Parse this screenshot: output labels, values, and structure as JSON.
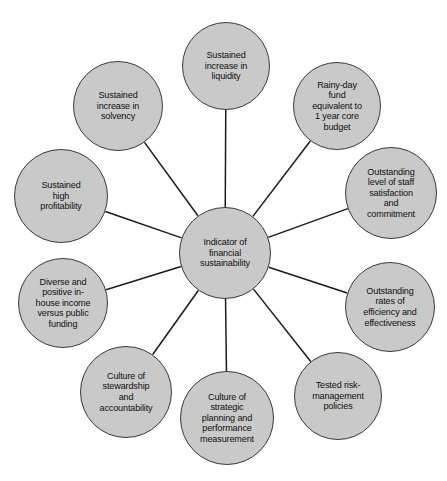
{
  "diagram": {
    "type": "hub-and-spoke",
    "title": "Indicator of financial sustainability",
    "colors": {
      "node_fill": "#c9c9c9",
      "node_border": "#3a3a3a",
      "spoke_line": "#1a1a1a",
      "text": "#101010",
      "background": "#ffffff"
    },
    "hub": {
      "id": "hub",
      "label": "Indicator of\nfinancial\nsustainability",
      "cx": 225,
      "cy": 253,
      "r": 46
    },
    "satellites": [
      {
        "id": "sustained-increase-in-liquidity",
        "label": "Sustained\nincrease in\nliquidity",
        "cx": 226,
        "cy": 66,
        "r": 44
      },
      {
        "id": "rainy-day-fund",
        "label": "Rainy-day\nfund\nequivalent to\n1 year core\nbudget",
        "cx": 337,
        "cy": 106,
        "r": 44
      },
      {
        "id": "staff-satisfaction-and-commitment",
        "label": "Outstanding\nlevel of staff\nsatisfaction\nand\ncommitment",
        "cx": 391,
        "cy": 193,
        "r": 46
      },
      {
        "id": "rates-of-efficiency-and-effectiveness",
        "label": "Outstanding\nrates of\nefficiency and\neffectiveness",
        "cx": 390,
        "cy": 307,
        "r": 45
      },
      {
        "id": "tested-risk-management-policies",
        "label": "Tested risk-\nmanagement\npolicies",
        "cx": 338,
        "cy": 396,
        "r": 44
      },
      {
        "id": "culture-of-strategic-planning",
        "label": "Culture of\nstrategic\nplanning and\nperformance\nmeasurement",
        "cx": 227,
        "cy": 418,
        "r": 47
      },
      {
        "id": "culture-of-stewardship-and-accountability",
        "label": "Culture of\nstewardship\nand\naccountability",
        "cx": 126,
        "cy": 392,
        "r": 46
      },
      {
        "id": "diverse-and-positive-in-house-income",
        "label": "Diverse and\npositive in-\nhouse income\nversus public\nfunding",
        "cx": 63,
        "cy": 303,
        "r": 45
      },
      {
        "id": "sustained-high-profitability",
        "label": "Sustained\nhigh\nprofitability",
        "cx": 61,
        "cy": 196,
        "r": 47
      },
      {
        "id": "sustained-increase-in-solvency",
        "label": "Sustained\nincrease in\nsolvency",
        "cx": 118,
        "cy": 106,
        "r": 45
      }
    ]
  }
}
